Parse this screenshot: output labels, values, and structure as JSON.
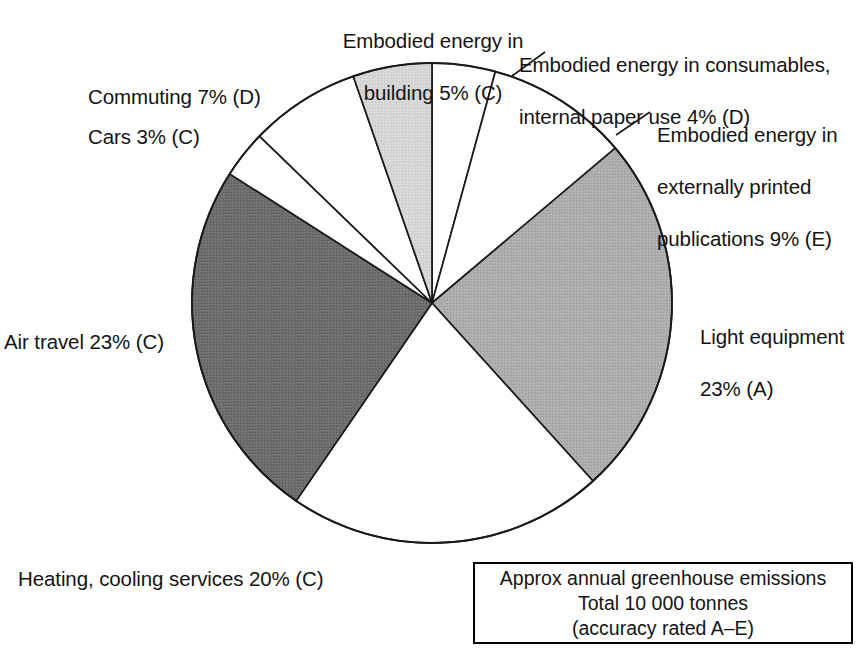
{
  "chart_data": {
    "type": "pie",
    "title": "",
    "subtitle": "",
    "units": "percent",
    "total_label": "Total 10 000 tonnes",
    "legend_position": "callout-labels",
    "grid": false,
    "start_angle_deg": 0,
    "direction": "clockwise",
    "categories": [
      "Embodied energy in consumables, internal paper use",
      "Embodied energy in externally printed publications",
      "Light equipment",
      "Heating, cooling services",
      "Air travel",
      "Cars",
      "Commuting",
      "Embodied energy in building"
    ],
    "values": [
      4,
      9,
      23,
      20,
      23,
      3,
      7,
      5
    ],
    "accuracy_ratings": [
      "D",
      "E",
      "A",
      "C",
      "C",
      "C",
      "D",
      "C"
    ],
    "slice_colors": [
      "#ffffff",
      "#ffffff",
      "#a8a8a8",
      "#ffffff",
      "#6b6b6b",
      "#ffffff",
      "#ffffff",
      "#d4d4d4"
    ],
    "annotations": [
      "Approx annual greenhouse emissions",
      "Total 10 000 tonnes",
      "(accuracy rated A–E)"
    ]
  },
  "pie": {
    "stroke_color": "#1a1a1a",
    "slices": [
      {
        "id": "consumables",
        "name": "Embodied energy in consumables, internal paper use",
        "percent": 4,
        "rating": "D",
        "fill": "#ffffff",
        "label_line1": "Embodied energy in consumables,",
        "label_line2": "internal paper use 4% (D)"
      },
      {
        "id": "printed-publications",
        "name": "Embodied energy in externally printed publications",
        "percent": 9,
        "rating": "E",
        "fill": "#ffffff",
        "label_line1": "Embodied energy in",
        "label_line2": "externally printed",
        "label_line3": "publications 9% (E)"
      },
      {
        "id": "light-equipment",
        "name": "Light equipment",
        "percent": 23,
        "rating": "A",
        "fill": "#a8a8a8",
        "label_line1": "Light equipment",
        "label_line2": "23% (A)"
      },
      {
        "id": "heating-cooling",
        "name": "Heating, cooling services",
        "percent": 20,
        "rating": "C",
        "fill": "#ffffff",
        "label_line1": "Heating, cooling services 20% (C)"
      },
      {
        "id": "air-travel",
        "name": "Air travel",
        "percent": 23,
        "rating": "C",
        "fill": "#6b6b6b",
        "label_line1": "Air travel 23% (C)"
      },
      {
        "id": "cars",
        "name": "Cars",
        "percent": 3,
        "rating": "C",
        "fill": "#ffffff",
        "label_line1": "Cars 3% (C)"
      },
      {
        "id": "commuting",
        "name": "Commuting",
        "percent": 7,
        "rating": "D",
        "fill": "#ffffff",
        "label_line1": "Commuting 7% (D)"
      },
      {
        "id": "embodied-building",
        "name": "Embodied energy in building",
        "percent": 5,
        "rating": "C",
        "fill": "#d4d4d4",
        "label_line1": "Embodied energy in",
        "label_line2": "building 5% (C)"
      }
    ]
  },
  "caption": {
    "line1": "Approx annual greenhouse emissions",
    "line2": "Total 10 000 tonnes",
    "line3": "(accuracy rated A–E)"
  }
}
